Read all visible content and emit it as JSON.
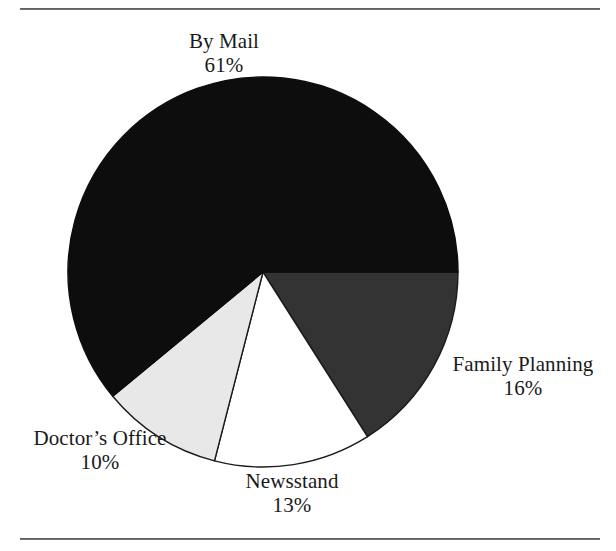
{
  "figure": {
    "background_color": "#ffffff",
    "rule_color": "#4a4a4a",
    "top_rule": "",
    "bottom_rule": ""
  },
  "chart_data": {
    "type": "pie",
    "title": "",
    "xlabel": "",
    "ylabel": "",
    "unit": "%",
    "start_angle_deg": 0,
    "direction": "clockwise",
    "center": {
      "x": 263,
      "y": 272
    },
    "radius": 195,
    "legend": "none",
    "labels_position": "outside",
    "categories": [
      "By Mail",
      "Family Planning",
      "Newsstand",
      "Doctor's Office"
    ],
    "values": [
      61,
      16,
      13,
      10
    ],
    "slices": [
      {
        "label": "By Mail",
        "value": 61,
        "value_text": "61%",
        "color": "#0d0d0d",
        "edge_color": "#0d0d0d"
      },
      {
        "label": "Family Planning",
        "value": 16,
        "value_text": "16%",
        "color": "#333333",
        "edge_color": "#1a1a1a"
      },
      {
        "label": "Newsstand",
        "value": 13,
        "value_text": "13%",
        "color": "#ffffff",
        "edge_color": "#1a1a1a"
      },
      {
        "label": "Doctor's Office",
        "value": 10,
        "value_text": "10%",
        "color": "#e8e8e8",
        "edge_color": "#1a1a1a"
      }
    ]
  },
  "labels": {
    "by_mail": {
      "name": "By Mail",
      "value": "61%"
    },
    "family_planning": {
      "name": "Family Planning",
      "value": "16%"
    },
    "doctors_office": {
      "name": "Doctor’s Office",
      "value": "10%"
    },
    "newsstand": {
      "name": "Newsstand",
      "value": "13%"
    }
  }
}
